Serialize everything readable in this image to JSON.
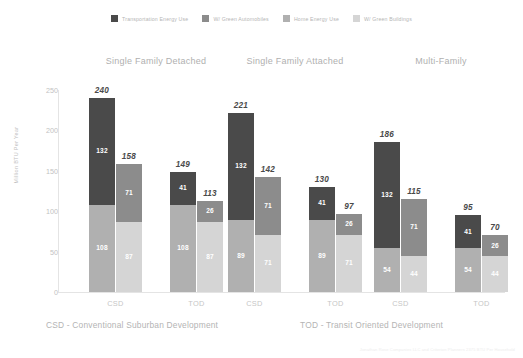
{
  "legend": {
    "items": [
      {
        "label": "Transportation Energy Use",
        "color": "#4a4a4a",
        "icon": "legend-swatch-icon"
      },
      {
        "label": "W/ Green Automobiles",
        "color": "#8c8c8c",
        "icon": "legend-swatch-icon"
      },
      {
        "label": "Home Energy Use",
        "color": "#b0b0b0",
        "icon": "legend-swatch-icon"
      },
      {
        "label": "W/ Green Buildings",
        "color": "#d5d5d5",
        "icon": "legend-swatch-icon"
      }
    ]
  },
  "axis": {
    "y_title": "Million BTU Per Year",
    "y_ticks": [
      "250",
      "200",
      "150",
      "100",
      "50",
      "0"
    ]
  },
  "footnotes": {
    "csd": "CSD -  Conventional Suburban Development",
    "tod": "TOD -  Transit Oriented Development",
    "attribution": "Jonathan Rose Companies LLC  and  Criterion Planners  2375 BTU Per Household"
  },
  "chart_data": {
    "type": "bar",
    "title": "",
    "xlabel": "",
    "ylabel": "Million BTU Per Year",
    "ylim": [
      0,
      250
    ],
    "grid": false,
    "legend_position": "top-center",
    "stacked": true,
    "series": [
      {
        "name": "Transportation Energy Use",
        "color": "#4a4a4a"
      },
      {
        "name": "W/ Green Automobiles",
        "color": "#8c8c8c"
      },
      {
        "name": "Home Energy Use",
        "color": "#b0b0b0"
      },
      {
        "name": "W/ Green Buildings",
        "color": "#d5d5d5"
      }
    ],
    "groups": [
      {
        "title": "Single Family Detached",
        "scenarios": [
          {
            "tick": "CSD",
            "bars": [
              {
                "total": 240,
                "segments": [
                  {
                    "series": "Transportation Energy Use",
                    "value": 132
                  },
                  {
                    "series": "Home Energy Use",
                    "value": 108
                  }
                ]
              },
              {
                "total": 158,
                "segments": [
                  {
                    "series": "W/ Green Automobiles",
                    "value": 71
                  },
                  {
                    "series": "W/ Green Buildings",
                    "value": 87
                  }
                ]
              }
            ]
          },
          {
            "tick": "TOD",
            "bars": [
              {
                "total": 149,
                "segments": [
                  {
                    "series": "Transportation Energy Use",
                    "value": 41
                  },
                  {
                    "series": "Home Energy Use",
                    "value": 108
                  }
                ]
              },
              {
                "total": 113,
                "segments": [
                  {
                    "series": "W/ Green Automobiles",
                    "value": 26
                  },
                  {
                    "series": "W/ Green Buildings",
                    "value": 87
                  }
                ]
              }
            ]
          }
        ]
      },
      {
        "title": "Single Family Attached",
        "scenarios": [
          {
            "tick": "CSD",
            "bars": [
              {
                "total": 221,
                "segments": [
                  {
                    "series": "Transportation Energy Use",
                    "value": 132
                  },
                  {
                    "series": "Home Energy Use",
                    "value": 89
                  }
                ]
              },
              {
                "total": 142,
                "segments": [
                  {
                    "series": "W/ Green Automobiles",
                    "value": 71
                  },
                  {
                    "series": "W/ Green Buildings",
                    "value": 71
                  }
                ]
              }
            ]
          },
          {
            "tick": "TOD",
            "bars": [
              {
                "total": 130,
                "segments": [
                  {
                    "series": "Transportation Energy Use",
                    "value": 41
                  },
                  {
                    "series": "Home Energy Use",
                    "value": 89
                  }
                ]
              },
              {
                "total": 97,
                "segments": [
                  {
                    "series": "W/ Green Automobiles",
                    "value": 26
                  },
                  {
                    "series": "W/ Green Buildings",
                    "value": 71
                  }
                ]
              }
            ]
          }
        ]
      },
      {
        "title": "Multi-Family",
        "scenarios": [
          {
            "tick": "CSD",
            "bars": [
              {
                "total": 186,
                "segments": [
                  {
                    "series": "Transportation Energy Use",
                    "value": 132
                  },
                  {
                    "series": "Home Energy Use",
                    "value": 54
                  }
                ]
              },
              {
                "total": 115,
                "segments": [
                  {
                    "series": "W/ Green Automobiles",
                    "value": 71
                  },
                  {
                    "series": "W/ Green Buildings",
                    "value": 44
                  }
                ]
              }
            ]
          },
          {
            "tick": "TOD",
            "bars": [
              {
                "total": 95,
                "segments": [
                  {
                    "series": "Transportation Energy Use",
                    "value": 41
                  },
                  {
                    "series": "Home Energy Use",
                    "value": 54
                  }
                ]
              },
              {
                "total": 70,
                "segments": [
                  {
                    "series": "W/ Green Automobiles",
                    "value": 26
                  },
                  {
                    "series": "W/ Green Buildings",
                    "value": 44
                  }
                ]
              }
            ]
          }
        ]
      }
    ]
  }
}
